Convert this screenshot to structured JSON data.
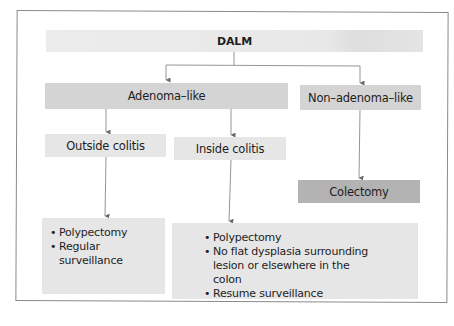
{
  "diagram": {
    "root": {
      "label": "DALM"
    },
    "level1": [
      {
        "id": "adenoma_like",
        "label": "Adenoma–like"
      },
      {
        "id": "non_adenoma_like",
        "label": "Non–adenoma–like"
      }
    ],
    "level2": [
      {
        "id": "outside_colitis",
        "label": "Outside colitis"
      },
      {
        "id": "inside_colitis",
        "label": "Inside colitis"
      },
      {
        "id": "colectomy",
        "label": "Colectomy"
      }
    ],
    "outcomes": {
      "outside": [
        "Polypectomy",
        "Regular surveillance"
      ],
      "inside": [
        "Polypectomy",
        "No flat dysplasia surrounding lesion or elsewhere in the colon",
        "Resume surveillance"
      ]
    }
  },
  "colors": {
    "top_fill": "#e8e8e8",
    "level1_fill": "#d4d4d4",
    "level2_fill": "#e6e6e6",
    "colectomy_fill": "#b3b3b3",
    "line": "#7a7a7a"
  }
}
